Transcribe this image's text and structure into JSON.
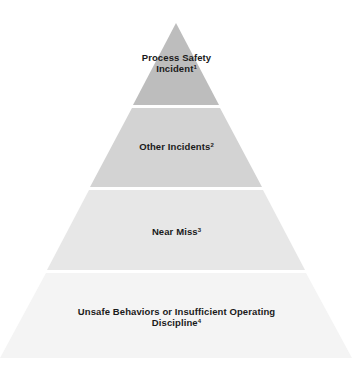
{
  "diagram": {
    "type": "pyramid",
    "tiers": [
      {
        "label_line1": "Process Safety",
        "label_line2": "Incident",
        "footnote": "1",
        "color": "#bdbdbd"
      },
      {
        "label_line1": "Other Incidents",
        "label_line2": "",
        "footnote": "2",
        "color": "#d3d3d3"
      },
      {
        "label_line1": "Near Miss",
        "label_line2": "",
        "footnote": "3",
        "color": "#e7e7e7"
      },
      {
        "label_line1": "Unsafe Behaviors or Insufficient Operating",
        "label_line2": "Discipline",
        "footnote": "4",
        "color": "#f4f4f4"
      }
    ]
  }
}
